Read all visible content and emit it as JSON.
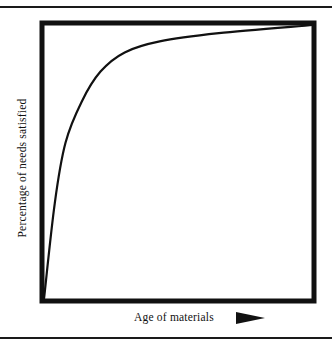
{
  "chart_data": {
    "type": "line",
    "title": "",
    "xlabel": "Age of materials",
    "ylabel": "Percentage of needs satisfied",
    "x_axis_arrow": "right-arrow",
    "grid": false,
    "legend": null,
    "ticks": {
      "x": [],
      "y": []
    },
    "xlim": [
      0,
      100
    ],
    "ylim": [
      0,
      100
    ],
    "series": [
      {
        "name": "needs-satisfied-curve",
        "x": [
          0,
          4,
          8,
          14,
          21,
          30,
          43,
          65,
          100
        ],
        "y": [
          0,
          35,
          57,
          72,
          83,
          90,
          94,
          97,
          100
        ]
      }
    ],
    "colors": {
      "line": "#111111",
      "frame": "#111111",
      "background": "#ffffff"
    }
  },
  "labels": {
    "xlabel": "Age of materials",
    "ylabel": "Percentage of needs satisfied"
  }
}
